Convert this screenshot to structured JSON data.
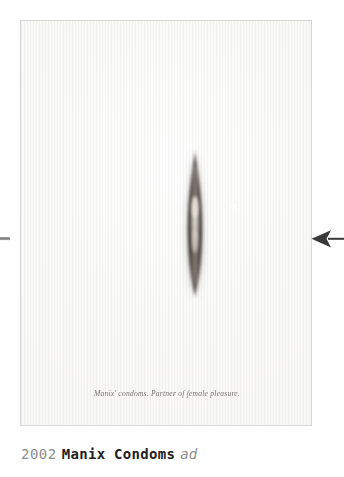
{
  "poster": {
    "tagline": "Manix' condoms. Partner of female pleasure.",
    "subject_name": "vertical-lens-aperture",
    "background_color": "#fbfbfa",
    "border_color": "#d6d6d6"
  },
  "navigation": {
    "prev_icon": "arrow-left-stub-icon",
    "next_icon": "arrow-left-icon",
    "arrow_color": "#3a3a3a"
  },
  "caption": {
    "year": "2002",
    "brand": "Manix Condoms",
    "kind": "ad",
    "year_color": "#8d8d8d",
    "brand_color": "#222222",
    "kind_color": "#8d8d8d"
  }
}
